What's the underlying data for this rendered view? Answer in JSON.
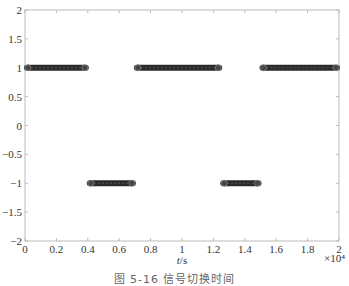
{
  "chart_data": {
    "type": "line",
    "title": "",
    "xlabel": "t/s",
    "ylabel": "",
    "x_multiplier": "×10⁴",
    "xlim": [
      0,
      2
    ],
    "ylim": [
      -2,
      2
    ],
    "x_ticks": [
      "0",
      "0.2",
      "0.4",
      "0.6",
      "0.8",
      "1",
      "1.2",
      "1.4",
      "1.6",
      "1.8",
      "2"
    ],
    "y_ticks": [
      "2",
      "1.5",
      "1",
      "0.5",
      "0",
      "−0.5",
      "−1",
      "−1.5",
      "−2"
    ],
    "grid": false,
    "legend": null,
    "marker": "circle",
    "series": [
      {
        "name": "switching signal",
        "segments": [
          {
            "x_start": 0.0,
            "x_end": 0.4,
            "y": 1
          },
          {
            "x_start": 0.4,
            "x_end": 0.7,
            "y": -1
          },
          {
            "x_start": 0.7,
            "x_end": 1.25,
            "y": 1
          },
          {
            "x_start": 1.25,
            "x_end": 1.5,
            "y": -1
          },
          {
            "x_start": 1.5,
            "x_end": 2.0,
            "y": 1
          }
        ]
      }
    ]
  },
  "caption": "图 5-16  信号切换时间"
}
